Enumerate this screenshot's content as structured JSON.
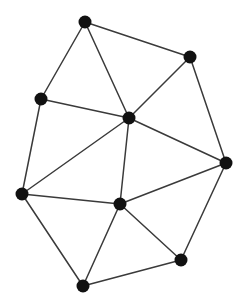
{
  "diagram": {
    "type": "undirected-graph",
    "canvas": {
      "width": 247,
      "height": 307,
      "background": "#ffffff"
    },
    "style": {
      "node_color": "#111111",
      "node_radius": 6.5,
      "edge_color": "#3a3a3a",
      "edge_width": 1.5
    },
    "nodes": [
      {
        "id": "A",
        "x": 85,
        "y": 22
      },
      {
        "id": "B",
        "x": 190,
        "y": 57
      },
      {
        "id": "C",
        "x": 41,
        "y": 99
      },
      {
        "id": "D",
        "x": 129,
        "y": 118
      },
      {
        "id": "E",
        "x": 226,
        "y": 163
      },
      {
        "id": "F",
        "x": 22,
        "y": 194
      },
      {
        "id": "G",
        "x": 120,
        "y": 204
      },
      {
        "id": "H",
        "x": 181,
        "y": 260
      },
      {
        "id": "I",
        "x": 83,
        "y": 286
      }
    ],
    "edges": [
      [
        "A",
        "B"
      ],
      [
        "A",
        "C"
      ],
      [
        "A",
        "D"
      ],
      [
        "B",
        "D"
      ],
      [
        "B",
        "E"
      ],
      [
        "C",
        "D"
      ],
      [
        "C",
        "F"
      ],
      [
        "D",
        "F"
      ],
      [
        "D",
        "G"
      ],
      [
        "D",
        "E"
      ],
      [
        "E",
        "G"
      ],
      [
        "E",
        "H"
      ],
      [
        "F",
        "G"
      ],
      [
        "F",
        "I"
      ],
      [
        "G",
        "I"
      ],
      [
        "G",
        "H"
      ],
      [
        "H",
        "I"
      ]
    ]
  }
}
